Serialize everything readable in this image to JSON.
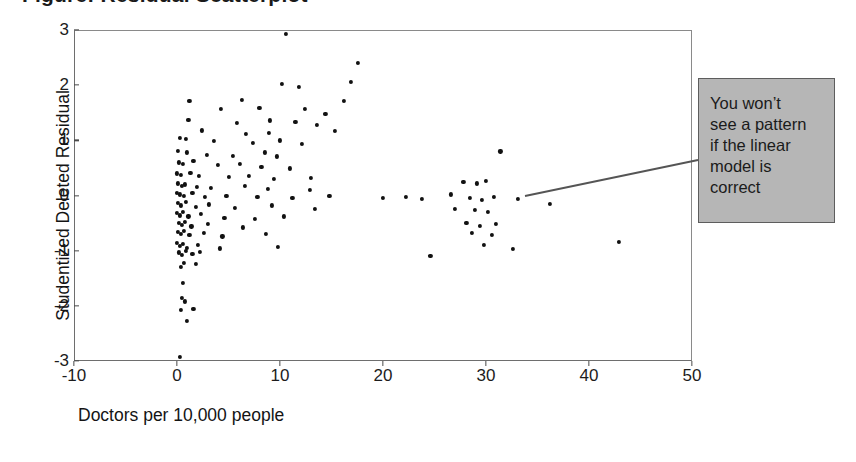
{
  "figure": {
    "cut_off_title": "Figure: Residual Scatterplot",
    "background_color": "#ffffff",
    "point_color": "#111111",
    "frame_color": "#6e6e6e"
  },
  "annotation": {
    "text": "You won’t\nsee a pattern\nif the linear\nmodel is\ncorrect",
    "background_color": "#b6b6b6",
    "border_color": "#5d5d5d",
    "leader_from": [
      698,
      160
    ],
    "leader_to": [
      525,
      196
    ]
  },
  "chart_data": {
    "type": "scatter",
    "title": "",
    "xlabel": "Doctors per 10,000 people",
    "ylabel": "Studentized Deleted Residual",
    "xlim": [
      -10,
      50
    ],
    "ylim": [
      -3,
      3
    ],
    "xticks": [
      -10,
      0,
      10,
      20,
      30,
      40,
      50
    ],
    "xtick_labels": [
      "-10",
      "0",
      "10",
      "20",
      "30",
      "40",
      "50"
    ],
    "yticks": [
      -3,
      -2,
      -1,
      0,
      1,
      2,
      3
    ],
    "ytick_labels": [
      "-3",
      "-2",
      "-1",
      "0",
      "1",
      "2",
      "3"
    ],
    "grid": false,
    "legend": false,
    "marker": "diamond",
    "points": [
      [
        10.6,
        2.93
      ],
      [
        17.6,
        2.4
      ],
      [
        10.2,
        2.03
      ],
      [
        11.8,
        1.97
      ],
      [
        1.2,
        1.72
      ],
      [
        6.3,
        1.73
      ],
      [
        16.9,
        2.06
      ],
      [
        4.3,
        1.57
      ],
      [
        8.0,
        1.59
      ],
      [
        12.4,
        1.57
      ],
      [
        14.4,
        1.48
      ],
      [
        16.2,
        1.72
      ],
      [
        1.1,
        1.37
      ],
      [
        5.8,
        1.32
      ],
      [
        9.0,
        1.36
      ],
      [
        11.5,
        1.33
      ],
      [
        13.6,
        1.28
      ],
      [
        2.4,
        1.18
      ],
      [
        6.7,
        1.12
      ],
      [
        8.9,
        1.14
      ],
      [
        15.3,
        1.17
      ],
      [
        0.3,
        1.05
      ],
      [
        0.9,
        1.02
      ],
      [
        3.6,
        0.99
      ],
      [
        7.4,
        0.96
      ],
      [
        10.0,
        1.0
      ],
      [
        12.1,
        0.94
      ],
      [
        0.1,
        0.81
      ],
      [
        1.0,
        0.78
      ],
      [
        2.9,
        0.74
      ],
      [
        5.4,
        0.72
      ],
      [
        8.5,
        0.78
      ],
      [
        9.7,
        0.71
      ],
      [
        31.4,
        0.8
      ],
      [
        0.2,
        0.6
      ],
      [
        0.6,
        0.58
      ],
      [
        1.6,
        0.62
      ],
      [
        4.0,
        0.55
      ],
      [
        6.1,
        0.57
      ],
      [
        8.2,
        0.52
      ],
      [
        11.0,
        0.49
      ],
      [
        0.0,
        0.4
      ],
      [
        0.4,
        0.38
      ],
      [
        1.3,
        0.41
      ],
      [
        2.1,
        0.36
      ],
      [
        5.0,
        0.33
      ],
      [
        7.0,
        0.35
      ],
      [
        9.4,
        0.3
      ],
      [
        13.0,
        0.32
      ],
      [
        0.1,
        0.22
      ],
      [
        0.5,
        0.18
      ],
      [
        0.8,
        0.2
      ],
      [
        1.9,
        0.16
      ],
      [
        3.3,
        0.14
      ],
      [
        6.6,
        0.18
      ],
      [
        8.8,
        0.12
      ],
      [
        12.9,
        0.1
      ],
      [
        27.8,
        0.25
      ],
      [
        29.1,
        0.22
      ],
      [
        30.0,
        0.27
      ],
      [
        0.0,
        0.05
      ],
      [
        0.3,
        0.02
      ],
      [
        0.7,
        0.0
      ],
      [
        1.5,
        0.04
      ],
      [
        2.7,
        -0.02
      ],
      [
        4.8,
        0.0
      ],
      [
        7.8,
        -0.03
      ],
      [
        11.2,
        -0.05
      ],
      [
        14.8,
        -0.01
      ],
      [
        20.0,
        -0.05
      ],
      [
        22.2,
        -0.03
      ],
      [
        23.8,
        -0.06
      ],
      [
        26.6,
        0.02
      ],
      [
        28.4,
        -0.04
      ],
      [
        29.6,
        -0.08
      ],
      [
        30.8,
        -0.02
      ],
      [
        33.1,
        -0.06
      ],
      [
        36.2,
        -0.15
      ],
      [
        0.1,
        -0.14
      ],
      [
        0.4,
        -0.18
      ],
      [
        0.9,
        -0.12
      ],
      [
        1.8,
        -0.2
      ],
      [
        3.1,
        -0.16
      ],
      [
        5.6,
        -0.22
      ],
      [
        9.2,
        -0.18
      ],
      [
        13.4,
        -0.25
      ],
      [
        27.0,
        -0.24
      ],
      [
        28.9,
        -0.26
      ],
      [
        30.2,
        -0.3
      ],
      [
        0.0,
        -0.32
      ],
      [
        0.3,
        -0.36
      ],
      [
        0.6,
        -0.3
      ],
      [
        1.1,
        -0.38
      ],
      [
        2.3,
        -0.34
      ],
      [
        4.6,
        -0.4
      ],
      [
        7.6,
        -0.42
      ],
      [
        10.4,
        -0.38
      ],
      [
        0.2,
        -0.5
      ],
      [
        0.5,
        -0.54
      ],
      [
        0.8,
        -0.48
      ],
      [
        1.4,
        -0.56
      ],
      [
        3.0,
        -0.52
      ],
      [
        6.4,
        -0.58
      ],
      [
        28.1,
        -0.5
      ],
      [
        29.4,
        -0.55
      ],
      [
        31.0,
        -0.52
      ],
      [
        0.1,
        -0.66
      ],
      [
        0.4,
        -0.7
      ],
      [
        0.7,
        -0.64
      ],
      [
        1.2,
        -0.72
      ],
      [
        2.6,
        -0.68
      ],
      [
        4.4,
        -0.74
      ],
      [
        8.6,
        -0.7
      ],
      [
        28.6,
        -0.68
      ],
      [
        30.6,
        -0.72
      ],
      [
        42.9,
        -0.84
      ],
      [
        0.0,
        -0.86
      ],
      [
        0.3,
        -0.92
      ],
      [
        0.6,
        -0.88
      ],
      [
        1.0,
        -0.95
      ],
      [
        2.0,
        -0.9
      ],
      [
        4.2,
        -0.96
      ],
      [
        9.8,
        -0.93
      ],
      [
        29.8,
        -0.9
      ],
      [
        32.6,
        -0.97
      ],
      [
        0.2,
        -1.03
      ],
      [
        0.5,
        -1.08
      ],
      [
        0.9,
        -1.0
      ],
      [
        1.5,
        -1.06
      ],
      [
        2.2,
        -1.02
      ],
      [
        24.6,
        -1.1
      ],
      [
        0.4,
        -1.3
      ],
      [
        0.7,
        -1.22
      ],
      [
        1.8,
        -1.24
      ],
      [
        0.6,
        -1.58
      ],
      [
        0.5,
        -1.86
      ],
      [
        0.8,
        -1.92
      ],
      [
        0.4,
        -2.08
      ],
      [
        1.6,
        -2.06
      ],
      [
        1.0,
        -2.28
      ],
      [
        0.3,
        -2.92
      ]
    ]
  }
}
